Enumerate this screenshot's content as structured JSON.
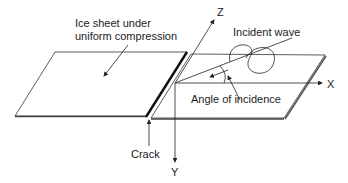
{
  "diagram": {
    "labels": {
      "ice_sheet_line1": "Ice sheet under",
      "ice_sheet_line2": "uniform compression",
      "incident_wave": "Incident wave",
      "angle": "Angle of incidence",
      "crack": "Crack",
      "axis_x": "X",
      "axis_y": "Y",
      "axis_z": "Z"
    },
    "colors": {
      "line": "#222222",
      "background": "#ffffff"
    }
  }
}
